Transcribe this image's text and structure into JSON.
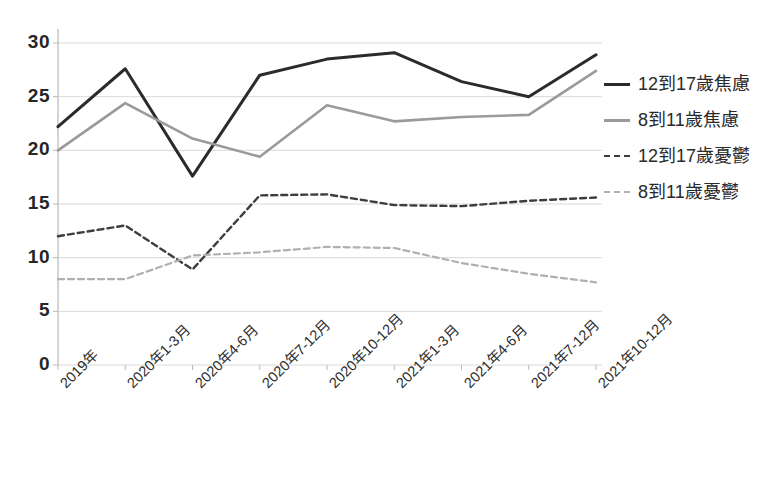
{
  "chart_data": {
    "type": "line",
    "title": "",
    "subtitle": "",
    "xlabel": "",
    "ylabel": "",
    "ylim": [
      0,
      30
    ],
    "yticks": [
      0,
      5,
      10,
      15,
      20,
      25,
      30
    ],
    "grid": true,
    "legend_position": "right",
    "categories": [
      "2019年",
      "2020年1-3月",
      "2020年4-6月",
      "2020年7-12月",
      "2020年10-12月",
      "2021年1-3月",
      "2021年4-6月",
      "2021年7-12月",
      "2021年10-12月"
    ],
    "series": [
      {
        "name": "12到17歲焦慮",
        "style": "solid",
        "color": "#2b2b2b",
        "width": 3,
        "values": [
          22.2,
          27.6,
          17.6,
          27.0,
          28.5,
          29.1,
          26.4,
          25.0,
          28.9
        ]
      },
      {
        "name": "8到11歲焦慮",
        "style": "solid",
        "color": "#9a9a9a",
        "width": 2.6,
        "values": [
          20.0,
          24.4,
          21.1,
          19.4,
          24.2,
          22.7,
          23.1,
          23.3,
          27.4
        ]
      },
      {
        "name": "12到17歲憂鬱",
        "style": "dashed",
        "color": "#3d3d3d",
        "width": 2.4,
        "values": [
          12.0,
          13.0,
          8.9,
          15.8,
          15.9,
          14.9,
          14.8,
          15.3,
          15.6
        ]
      },
      {
        "name": "8到11歲憂鬱",
        "style": "dashed",
        "color": "#b0b0b0",
        "width": 2.2,
        "values": [
          8.0,
          8.0,
          10.2,
          10.5,
          11.0,
          10.9,
          9.5,
          8.5,
          7.7
        ]
      }
    ]
  },
  "legend": {
    "items": [
      {
        "label": "12到17歲焦慮",
        "swatch": "solid-dark-line-icon"
      },
      {
        "label": "8到11歲焦慮",
        "swatch": "solid-gray-line-icon"
      },
      {
        "label": "12到17歲憂鬱",
        "swatch": "dashed-dark-line-icon"
      },
      {
        "label": "8到11歲憂鬱",
        "swatch": "dashed-gray-line-icon"
      }
    ]
  },
  "axes": {
    "y_tick_labels": [
      "30",
      "25",
      "20",
      "15",
      "10",
      "5",
      "0"
    ],
    "x_tick_labels": [
      "2019年",
      "2020年1-3月",
      "2020年4-6月",
      "2020年7-12月",
      "2020年10-12月",
      "2021年1-3月",
      "2021年4-6月",
      "2021年7-12月",
      "2021年10-12月"
    ]
  },
  "colors": {
    "grid": "#d9d9d9",
    "axis": "#b8b8b8",
    "series_dark": "#2b2b2b",
    "series_gray": "#9a9a9a",
    "series_dark_dashed": "#3d3d3d",
    "series_gray_dashed": "#b0b0b0",
    "text": "#2a2a2a"
  }
}
